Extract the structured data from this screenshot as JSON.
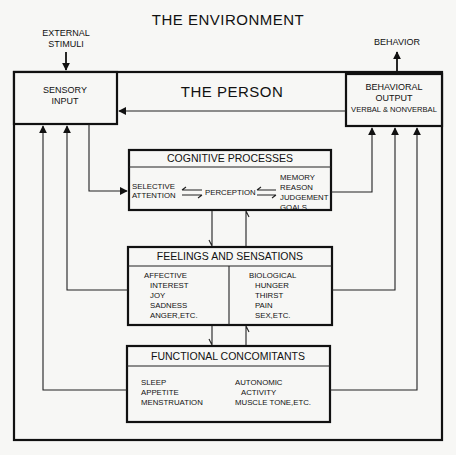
{
  "diagram": {
    "environment_title": "THE ENVIRONMENT",
    "person_title": "THE PERSON",
    "external_stimuli": [
      "EXTERNAL",
      "STIMULI"
    ],
    "behavior_label": "BEHAVIOR",
    "sensory_input": [
      "SENSORY",
      "INPUT"
    ],
    "behavioral_output": [
      "BEHAVIORAL",
      "OUTPUT",
      "VERBAL & NONVERBAL"
    ],
    "cognitive": {
      "title": "COGNITIVE PROCESSES",
      "selective_attention": [
        "SELECTIVE",
        "ATTENTION"
      ],
      "perception": "PERCEPTION",
      "higher": [
        "MEMORY",
        "REASON",
        "JUDGEMENT",
        "GOALS"
      ]
    },
    "feelings": {
      "title": "FEELINGS AND SENSATIONS",
      "affective_heading": "AFFECTIVE",
      "affective_items": [
        "INTEREST",
        "JOY",
        "SADNESS",
        "ANGER,ETC."
      ],
      "biological_heading": "BIOLOGICAL",
      "biological_items": [
        "HUNGER",
        "THIRST",
        "PAIN",
        "SEX,ETC."
      ]
    },
    "functional": {
      "title": "FUNCTIONAL CONCOMITANTS",
      "left_items": [
        "SLEEP",
        "APPETITE",
        "MENSTRUATION"
      ],
      "right_items": [
        "AUTONOMIC",
        "ACTIVITY",
        "MUSCLE TONE,ETC."
      ]
    }
  }
}
